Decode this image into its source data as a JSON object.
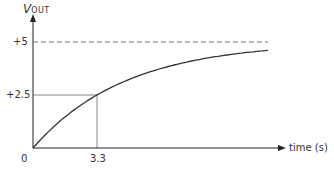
{
  "chart_data": {
    "type": "line",
    "title": "",
    "xlabel": "time (s)",
    "ylabel": "V",
    "ylabel_sub": "OUT",
    "xlim": [
      0,
      13.5
    ],
    "ylim": [
      0,
      5.5
    ],
    "grid": false,
    "legend": null,
    "series": [
      {
        "name": "V_OUT charging curve",
        "formula": "V = 5(1 - e^(-t/4.76))",
        "x": [
          0,
          1,
          2,
          3.3,
          5,
          7,
          9,
          12.1
        ],
        "values": [
          0,
          0.95,
          1.71,
          2.5,
          3.25,
          3.85,
          4.24,
          4.6
        ]
      }
    ],
    "asymptote": {
      "value": 5,
      "label": "+5",
      "style": "dashed"
    },
    "annotations": [
      {
        "type": "hline",
        "y": 2.5,
        "label": "+2.5",
        "x_end": 3.3
      },
      {
        "type": "vline",
        "x": 3.3,
        "label": "3.3",
        "y_end": 2.5
      }
    ],
    "tick_labels": {
      "origin": "0",
      "x": [
        "3.3"
      ],
      "y": [
        "+2.5",
        "+5"
      ]
    }
  },
  "labels": {
    "y_axis_main": "V",
    "y_axis_sub": "OUT",
    "y_tick_5": "+5",
    "y_tick_2_5": "+2.5",
    "origin": "0",
    "x_tick_3_3": "3.3",
    "x_axis": "time (s)"
  },
  "colors": {
    "axis": "#222222",
    "curve": "#333333",
    "guide": "#666666",
    "dashed": "#777777"
  }
}
